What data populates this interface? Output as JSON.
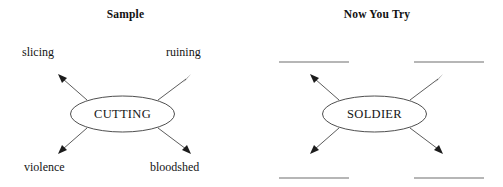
{
  "document": {
    "type": "word-web-worksheet",
    "background_color": "#ffffff",
    "ink_color": "#1a1a1a"
  },
  "panels": {
    "sample": {
      "title": "Sample",
      "center": {
        "label": "CUTTING",
        "shape": "ellipse"
      },
      "branches": [
        {
          "position": "top-left",
          "label": "slicing",
          "filled": true
        },
        {
          "position": "top-right",
          "label": "ruining",
          "filled": true
        },
        {
          "position": "bottom-left",
          "label": "violence",
          "filled": true
        },
        {
          "position": "bottom-right",
          "label": "bloodshed",
          "filled": true
        }
      ]
    },
    "practice": {
      "title": "Now You Try",
      "center": {
        "label": "SOLDIER",
        "shape": "ellipse"
      },
      "branches": [
        {
          "position": "top-left",
          "label": "",
          "filled": false
        },
        {
          "position": "top-right",
          "label": "",
          "filled": false
        },
        {
          "position": "bottom-left",
          "label": "",
          "filled": false
        },
        {
          "position": "bottom-right",
          "label": "",
          "filled": false
        }
      ]
    }
  }
}
